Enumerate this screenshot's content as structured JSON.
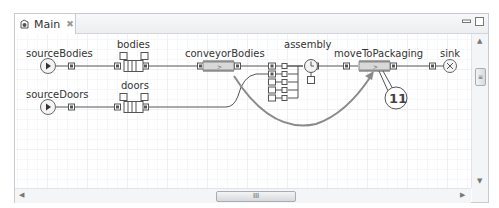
{
  "tab": {
    "label": "Main",
    "close_glyph": "✖"
  },
  "scrollbar": {
    "h_thumb_glyph": "III",
    "v_thumb_glyph": "≡"
  },
  "blocks": {
    "sourceBodies": "sourceBodies",
    "bodies": "bodies",
    "conveyorBodies": "conveyorBodies",
    "assembly": "assembly",
    "moveToPackaging": "moveToPackaging",
    "sink": "sink",
    "sourceDoors": "sourceDoors",
    "doors": "doors"
  },
  "callout": {
    "number": "11"
  },
  "colors": {
    "connector": "#555555",
    "arrow": "#8a8a8a",
    "port_fill": "#555555"
  }
}
